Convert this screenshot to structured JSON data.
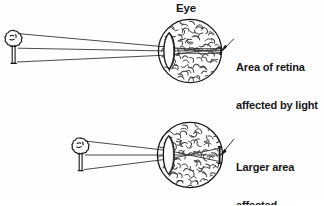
{
  "diagram": {
    "title_label": "Eye",
    "panels": [
      {
        "id": "far-object",
        "object_name": "tree",
        "object_position": "far",
        "annotation_line1": "Area of retina",
        "annotation_line2": "affected by light",
        "eye": {
          "center_x": 190,
          "center_y": 51,
          "radius": 32,
          "lens_label": "lens",
          "retina_label": "retina"
        },
        "ray_count": 2,
        "affected_area_size": "small"
      },
      {
        "id": "near-object",
        "object_name": "tree",
        "object_position": "near",
        "annotation_line1": "Larger area",
        "annotation_line2": "affected",
        "eye": {
          "center_x": 190,
          "center_y": 155,
          "radius": 33,
          "lens_label": "lens",
          "retina_label": "retina"
        },
        "ray_count": 2,
        "affected_area_size": "large"
      }
    ],
    "colors": {
      "ink": "#16161a",
      "line": "#2a2a2e",
      "background": "#fefefe",
      "texture": "#3a3a40"
    }
  }
}
